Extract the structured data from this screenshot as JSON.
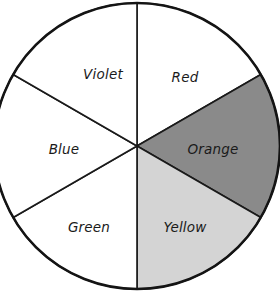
{
  "figure": {
    "name": "color-wheel",
    "shape": "circle",
    "background_color": "#ffffff",
    "outline_color": "#141414",
    "center_x": 137,
    "center_y": 146,
    "radius": 143,
    "sector_count": 6,
    "sector_angle_degrees": 60
  },
  "chart_data": {
    "type": "pie",
    "title": "",
    "xlabel": "",
    "ylabel": "",
    "legend_position": "none",
    "grid": false,
    "categories": [
      "Red",
      "Orange",
      "Yellow",
      "Green",
      "Blue",
      "Violet"
    ],
    "values": [
      1,
      1,
      1,
      1,
      1,
      1
    ],
    "percentages": [
      16.67,
      16.67,
      16.67,
      16.67,
      16.67,
      16.67
    ],
    "slices": [
      {
        "label": "Red",
        "value": 1,
        "percent": 16.67,
        "start_angle": 90,
        "end_angle": 30,
        "fill": "#ffffff",
        "label_x": 185,
        "label_y": 78
      },
      {
        "label": "Orange",
        "value": 1,
        "percent": 16.67,
        "start_angle": 30,
        "end_angle": -30,
        "fill": "#8a8a8a",
        "label_x": 213,
        "label_y": 150
      },
      {
        "label": "Yellow",
        "value": 1,
        "percent": 16.67,
        "start_angle": -30,
        "end_angle": -90,
        "fill": "#d4d4d4",
        "label_x": 185,
        "label_y": 228
      },
      {
        "label": "Green",
        "value": 1,
        "percent": 16.67,
        "start_angle": -90,
        "end_angle": -150,
        "fill": "#ffffff",
        "label_x": 89,
        "label_y": 228
      },
      {
        "label": "Blue",
        "value": 1,
        "percent": 16.67,
        "start_angle": -150,
        "end_angle": 150,
        "fill": "#ffffff",
        "label_x": 64,
        "label_y": 150
      },
      {
        "label": "Violet",
        "value": 1,
        "percent": 16.67,
        "start_angle": 150,
        "end_angle": 90,
        "fill": "#ffffff",
        "label_x": 103,
        "label_y": 75
      }
    ]
  }
}
